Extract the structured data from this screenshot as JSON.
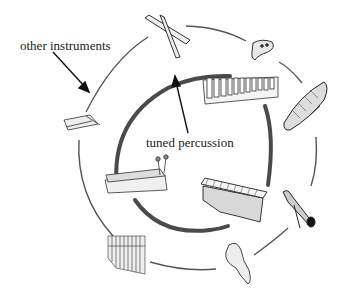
{
  "diagram": {
    "labels": {
      "other_instruments": "other instruments",
      "tuned_percussion": "tuned percussion"
    },
    "outer_ring": {
      "group": "other instruments",
      "items": [
        {
          "name": "claves",
          "icon": "claves-icon"
        },
        {
          "name": "ocarina",
          "icon": "ocarina-icon"
        },
        {
          "name": "guiro",
          "icon": "guiro-icon"
        },
        {
          "name": "rainstick / shaker",
          "icon": "shaker-icon"
        },
        {
          "name": "gourd maraca",
          "icon": "gourd-icon"
        },
        {
          "name": "pan pipes",
          "icon": "pan-pipes-icon"
        },
        {
          "name": "zither",
          "icon": "zither-icon"
        }
      ]
    },
    "inner_ring": {
      "group": "tuned percussion",
      "items": [
        {
          "name": "glockenspiel",
          "icon": "glockenspiel-icon"
        },
        {
          "name": "xylophone",
          "icon": "xylophone-icon"
        },
        {
          "name": "alto metallophone",
          "icon": "metallophone-icon"
        }
      ]
    },
    "colors": {
      "outer_ring": "#555555",
      "inner_ring": "#4a4a4a",
      "ink": "#222222"
    }
  }
}
